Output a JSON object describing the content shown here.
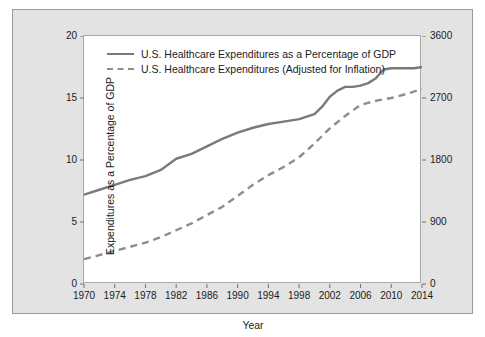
{
  "chart_data": {
    "type": "line",
    "title": "",
    "xlabel": "Year",
    "ylabel": "Expenditures as a Percentage of GDP",
    "ylabel_right": "Expenditures in Billions of Dollars",
    "xlim": [
      1970,
      2014
    ],
    "ylim": [
      0,
      20
    ],
    "ylim_right": [
      0,
      3600
    ],
    "xticks": [
      1970,
      1974,
      1978,
      1982,
      1986,
      1990,
      1994,
      1998,
      2002,
      2006,
      2010,
      2014
    ],
    "yticks_left": [
      0,
      5,
      10,
      15,
      20
    ],
    "yticks_right": [
      0,
      900,
      1800,
      2700,
      3600
    ],
    "grid": false,
    "legend_position": "top-left inside",
    "series": [
      {
        "name": "U.S. Healthcare Expenditures as a Percentage of GDP",
        "axis": "left",
        "style": "solid",
        "color": "#7a7a7a",
        "x": [
          1970,
          1972,
          1974,
          1976,
          1978,
          1980,
          1982,
          1984,
          1986,
          1988,
          1990,
          1992,
          1994,
          1996,
          1998,
          2000,
          2001,
          2002,
          2003,
          2004,
          2005,
          2006,
          2007,
          2008,
          2009,
          2010,
          2011,
          2012,
          2013,
          2014
        ],
        "values": [
          7.2,
          7.6,
          8.0,
          8.4,
          8.7,
          9.2,
          10.1,
          10.5,
          11.1,
          11.7,
          12.2,
          12.6,
          12.9,
          13.1,
          13.3,
          13.7,
          14.3,
          15.1,
          15.6,
          15.9,
          15.9,
          16.0,
          16.2,
          16.6,
          17.3,
          17.4,
          17.4,
          17.4,
          17.4,
          17.5
        ],
        "unit": "percent of GDP"
      },
      {
        "name": "U.S. Healthcare Expenditures (Adjusted for Inflation)",
        "axis": "right",
        "style": "dashed",
        "color": "#8d8d8d",
        "x": [
          1970,
          1972,
          1974,
          1976,
          1978,
          1980,
          1982,
          1984,
          1986,
          1988,
          1990,
          1992,
          1994,
          1996,
          1998,
          2000,
          2002,
          2004,
          2006,
          2008,
          2010,
          2012,
          2014
        ],
        "values": [
          360,
          420,
          480,
          540,
          600,
          680,
          780,
          880,
          1000,
          1120,
          1280,
          1440,
          1580,
          1700,
          1840,
          2040,
          2260,
          2440,
          2600,
          2660,
          2700,
          2760,
          2830
        ],
        "unit": "billions of dollars"
      }
    ]
  },
  "legend": {
    "items": [
      {
        "label": "U.S. Healthcare Expenditures as a Percentage of GDP",
        "style": "solid"
      },
      {
        "label": "U.S. Healthcare Expenditures (Adjusted for Inflation)",
        "style": "dashed"
      }
    ]
  },
  "axes": {
    "x_title": "Year",
    "y_left_title": "Expenditures as a Percentage of GDP",
    "y_right_title": "Expenditures in Billions of Dollars",
    "x_ticks": [
      "1970",
      "1974",
      "1978",
      "1982",
      "1986",
      "1990",
      "1994",
      "1998",
      "2002",
      "2006",
      "2010",
      "2014"
    ],
    "y_left_ticks": [
      "20",
      "15",
      "10",
      "5",
      "0"
    ],
    "y_right_ticks": [
      "3600",
      "2700",
      "1800",
      "900",
      "0"
    ]
  },
  "colors": {
    "panel_background": "#e3e3e3",
    "plot_background": "#ffffff",
    "series_solid": "#7a7a7a",
    "series_dashed": "#8d8d8d",
    "text": "#1b1b1b"
  }
}
